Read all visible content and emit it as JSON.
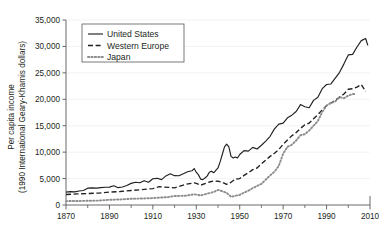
{
  "chart_data": {
    "type": "line",
    "title": "",
    "subtitle": "",
    "xlabel": "",
    "ylabel": "Per capita income\n(1990 International Geary-Khamis dollars)",
    "ylabel_line1": "Per capita income",
    "ylabel_line2": "(1990 International Geary-Khamis dollars)",
    "xlim": [
      1870,
      2010
    ],
    "ylim": [
      0,
      35000
    ],
    "grid": false,
    "legend_position": "top-left",
    "x_ticks_major": [
      1870,
      1890,
      1910,
      1930,
      1950,
      1970,
      1990,
      2010
    ],
    "x_ticks_minor": [
      1880,
      1900,
      1920,
      1940,
      1960,
      1980,
      2000
    ],
    "x_tick_labels": [
      "1870",
      "1890",
      "1910",
      "1930",
      "1950",
      "1970",
      "1990",
      "2010"
    ],
    "y_ticks": [
      0,
      5000,
      10000,
      15000,
      20000,
      25000,
      30000,
      35000
    ],
    "y_tick_labels": [
      "0",
      "5,000",
      "10,000",
      "15,000",
      "20,000",
      "25,000",
      "30,000",
      "35,000"
    ],
    "series": [
      {
        "name": "United States",
        "style": "solid",
        "color": "#231f20",
        "x": [
          1870,
          1872,
          1874,
          1876,
          1878,
          1880,
          1882,
          1884,
          1886,
          1888,
          1890,
          1892,
          1894,
          1896,
          1898,
          1900,
          1902,
          1904,
          1906,
          1908,
          1910,
          1912,
          1914,
          1916,
          1918,
          1920,
          1922,
          1924,
          1926,
          1928,
          1929,
          1930,
          1931,
          1932,
          1933,
          1934,
          1935,
          1936,
          1937,
          1938,
          1939,
          1940,
          1941,
          1942,
          1943,
          1944,
          1945,
          1946,
          1947,
          1948,
          1949,
          1950,
          1952,
          1954,
          1956,
          1958,
          1960,
          1962,
          1964,
          1966,
          1968,
          1970,
          1972,
          1974,
          1976,
          1978,
          1980,
          1982,
          1984,
          1986,
          1988,
          1990,
          1992,
          1994,
          1996,
          1998,
          2000,
          2002,
          2004,
          2006,
          2008,
          2009
        ],
        "values": [
          2445,
          2520,
          2480,
          2650,
          2750,
          3180,
          3250,
          3200,
          3300,
          3350,
          3390,
          3630,
          3280,
          3400,
          3700,
          4090,
          4300,
          4200,
          4600,
          4300,
          4960,
          5050,
          4800,
          5500,
          5900,
          5550,
          5540,
          5900,
          6300,
          6470,
          6900,
          6200,
          5700,
          4900,
          4800,
          5100,
          5460,
          6200,
          6400,
          6100,
          6560,
          7010,
          8200,
          9600,
          11000,
          11500,
          11000,
          9200,
          8900,
          9100,
          8900,
          9560,
          10300,
          10200,
          10900,
          10600,
          11300,
          12100,
          13000,
          14400,
          15300,
          15500,
          16500,
          17000,
          17700,
          19000,
          18600,
          18400,
          19800,
          20400,
          22000,
          22800,
          22900,
          24000,
          25100,
          26700,
          28400,
          28500,
          29900,
          31100,
          31500,
          30200
        ]
      },
      {
        "name": "Western Europe",
        "style": "dashed",
        "color": "#231f20",
        "x": [
          1870,
          1875,
          1880,
          1885,
          1890,
          1895,
          1900,
          1905,
          1910,
          1913,
          1920,
          1925,
          1929,
          1930,
          1932,
          1934,
          1936,
          1938,
          1940,
          1942,
          1944,
          1946,
          1948,
          1950,
          1952,
          1954,
          1956,
          1958,
          1960,
          1962,
          1964,
          1966,
          1968,
          1970,
          1972,
          1974,
          1976,
          1978,
          1980,
          1982,
          1984,
          1986,
          1988,
          1990,
          1992,
          1994,
          1996,
          1998,
          2000,
          2002,
          2004,
          2006,
          2008
        ],
        "values": [
          1990,
          2090,
          2170,
          2250,
          2440,
          2550,
          2740,
          2900,
          3100,
          3460,
          3250,
          3900,
          4200,
          4100,
          3750,
          4050,
          4350,
          4550,
          4500,
          4300,
          3900,
          4300,
          4900,
          5000,
          5600,
          6100,
          6700,
          7000,
          7800,
          8500,
          9200,
          9800,
          10500,
          11500,
          12300,
          13100,
          13700,
          14500,
          15200,
          15500,
          16300,
          17100,
          18000,
          18800,
          19300,
          19800,
          20400,
          21000,
          21900,
          22000,
          22300,
          22800,
          21500
        ]
      },
      {
        "name": "Japan",
        "style": "dotted",
        "color": "#8c8c8c",
        "x": [
          1870,
          1875,
          1880,
          1885,
          1890,
          1895,
          1900,
          1905,
          1910,
          1913,
          1917,
          1920,
          1925,
          1929,
          1932,
          1935,
          1938,
          1940,
          1942,
          1944,
          1946,
          1948,
          1950,
          1952,
          1954,
          1956,
          1958,
          1960,
          1962,
          1964,
          1966,
          1968,
          1970,
          1972,
          1974,
          1976,
          1978,
          1980,
          1982,
          1984,
          1986,
          1988,
          1990,
          1992,
          1994,
          1996,
          1998,
          2000,
          2002,
          2003
        ],
        "values": [
          737,
          760,
          800,
          830,
          980,
          1050,
          1180,
          1230,
          1300,
          1390,
          1500,
          1700,
          1750,
          2030,
          1800,
          2150,
          2450,
          2870,
          2600,
          2300,
          1550,
          1750,
          1920,
          2340,
          2700,
          3200,
          3600,
          4000,
          4800,
          5600,
          6300,
          7400,
          9710,
          11000,
          11400,
          12200,
          13200,
          13400,
          14100,
          15000,
          15900,
          17600,
          18800,
          19300,
          19600,
          20400,
          20200,
          20700,
          21000,
          21000
        ]
      }
    ]
  },
  "legend": {
    "items": [
      {
        "label": "United States",
        "style": "solid"
      },
      {
        "label": "Western Europe",
        "style": "dashed"
      },
      {
        "label": "Japan",
        "style": "dotted"
      }
    ]
  }
}
